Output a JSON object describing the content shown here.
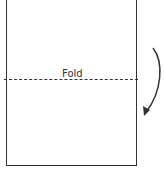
{
  "diagram": {
    "fold_label": "Fold",
    "line_color": "#333333",
    "arrow": {
      "direction": "down-curved",
      "meaning": "fold-top-half-down"
    }
  }
}
